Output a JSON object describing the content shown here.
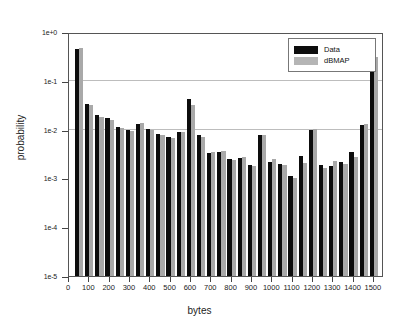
{
  "chart_data": {
    "type": "bar",
    "title": "",
    "xlabel": "bytes",
    "ylabel": "probability",
    "yscale": "log",
    "ylim": [
      1e-05,
      1
    ],
    "xlim": [
      0,
      1550
    ],
    "grid": true,
    "legend_position": "top-right",
    "ytick_labels": [
      "1e+0",
      "1e-1",
      "1e-2",
      "1e-3",
      "1e-4",
      "1e-5"
    ],
    "ytick_values": [
      1,
      0.1,
      0.01,
      0.001,
      0.0001,
      1e-05
    ],
    "xtick_labels": [
      "0",
      "100",
      "200",
      "300",
      "400",
      "500",
      "600",
      "700",
      "800",
      "900",
      "1000",
      "1100",
      "1200",
      "1300",
      "1400",
      "1500"
    ],
    "xtick_values": [
      0,
      100,
      200,
      300,
      400,
      500,
      600,
      700,
      800,
      900,
      1000,
      1100,
      1200,
      1300,
      1400,
      1500
    ],
    "categories": [
      50,
      100,
      150,
      200,
      250,
      300,
      350,
      400,
      450,
      500,
      550,
      600,
      650,
      700,
      750,
      800,
      850,
      900,
      950,
      1000,
      1050,
      1100,
      1150,
      1200,
      1250,
      1300,
      1350,
      1400,
      1450,
      1500
    ],
    "series": [
      {
        "name": "Data",
        "color": "#0d0d0d",
        "values": [
          0.44,
          0.034,
          0.02,
          0.017,
          0.0115,
          0.01,
          0.013,
          0.0105,
          0.0082,
          0.007,
          0.009,
          0.042,
          0.0077,
          0.0033,
          0.0035,
          0.0025,
          0.0026,
          0.0019,
          0.0077,
          0.0022,
          0.002,
          0.0011,
          0.0029,
          0.01,
          0.0019,
          0.0018,
          0.0022,
          0.0035,
          0.0125,
          0.3
        ]
      },
      {
        "name": "dBMAP",
        "color": "#a9a9a9",
        "values": [
          0.46,
          0.032,
          0.0185,
          0.016,
          0.0108,
          0.0094,
          0.0135,
          0.01,
          0.0078,
          0.0068,
          0.009,
          0.032,
          0.0072,
          0.0034,
          0.0036,
          0.0024,
          0.0028,
          0.0018,
          0.0076,
          0.0025,
          0.0019,
          0.001,
          0.0021,
          0.0101,
          0.0016,
          0.0023,
          0.002,
          0.0027,
          0.013,
          0.31
        ]
      }
    ]
  },
  "legend": {
    "entries": [
      {
        "label": "Data"
      },
      {
        "label": "dBMAP"
      }
    ]
  }
}
